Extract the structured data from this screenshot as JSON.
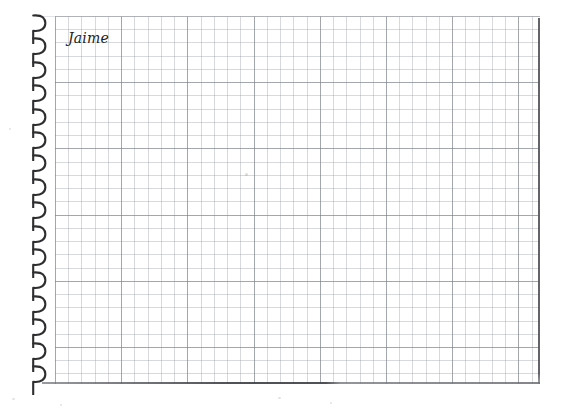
{
  "document": {
    "type": "spiral-bound-graph-paper-notebook",
    "orientation": "landscape",
    "page_background": "#ffffff",
    "canvas_background": "#ffffff"
  },
  "page": {
    "handwritten_name": "Jaime",
    "name_color": "#1c1c1e",
    "name_style": "italic"
  },
  "grid": {
    "minor_cell_px": 13.24,
    "major_every_n_cells": 5,
    "minor_line_color": "#969ba5",
    "major_line_color": "#787d87",
    "grid_visible": "true"
  },
  "borders": {
    "right_edge_color": "#5a5c62",
    "bottom_edge_color": "#46484e",
    "top_edge_color": "#bec1c8"
  },
  "binding": {
    "icon": "spiral-wire-ring-icon",
    "ring_color": "#2e2e30",
    "ring_count": 16,
    "ring_pitch_px": 23.4
  },
  "marks": {
    "smudges": [
      {
        "x": 203,
        "y": 157,
        "w": 3,
        "h": 3
      }
    ],
    "specks": [
      {
        "x": 12,
        "y": 398,
        "w": 3,
        "h": 2
      },
      {
        "x": 60,
        "y": 404,
        "w": 2,
        "h": 2
      },
      {
        "x": 278,
        "y": 397,
        "w": 3,
        "h": 2
      },
      {
        "x": 330,
        "y": 402,
        "w": 2,
        "h": 2
      },
      {
        "x": 9,
        "y": 128,
        "w": 2,
        "h": 2
      }
    ]
  }
}
